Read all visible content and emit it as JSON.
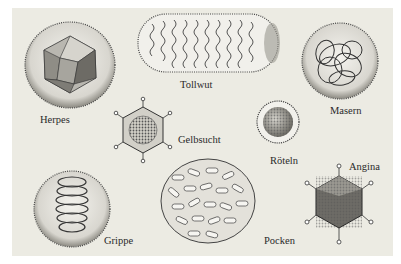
{
  "figure": {
    "background_color": "#ecebe3",
    "page_color": "#ffffff",
    "viruses": [
      {
        "name": "Herpes",
        "shape": "icosahedron-in-envelope"
      },
      {
        "name": "Tollwut",
        "shape": "bullet-rod"
      },
      {
        "name": "Masern",
        "shape": "sphere-with-coiled-strands"
      },
      {
        "name": "Gelbsucht",
        "shape": "icosahedron-with-spikes"
      },
      {
        "name": "Röteln",
        "shape": "knobbed-sphere"
      },
      {
        "name": "Angina",
        "shape": "icosahedron-with-fibers"
      },
      {
        "name": "Grippe",
        "shape": "sphere-with-helix"
      },
      {
        "name": "Pocken",
        "shape": "brick-ovoid"
      }
    ]
  },
  "labels": {
    "herpes": "Herpes",
    "tollwut": "Tollwut",
    "masern": "Masern",
    "gelbsucht": "Gelbsucht",
    "roeteln": "Röteln",
    "angina": "Angina",
    "grippe": "Grippe",
    "pocken": "Pocken"
  }
}
